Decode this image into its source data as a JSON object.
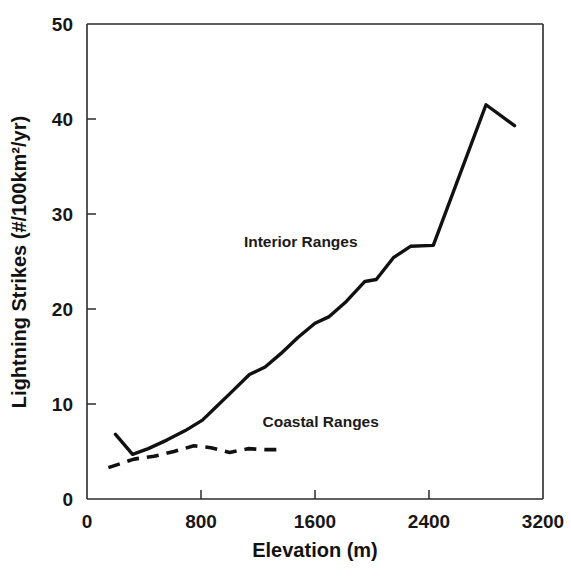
{
  "chart_data": {
    "type": "line",
    "title": "",
    "xlabel": "Elevation (m)",
    "ylabel": "Lightning Strikes (#/100km²/yr)",
    "xlim": [
      0,
      3200
    ],
    "ylim": [
      0,
      50
    ],
    "xticks": [
      0,
      800,
      1600,
      2400,
      3200
    ],
    "yticks": [
      0,
      10,
      20,
      30,
      40,
      50
    ],
    "xtick_labels": [
      "0",
      "800",
      "1600",
      "2400",
      "3200"
    ],
    "ytick_labels": [
      "0",
      "10",
      "20",
      "30",
      "40",
      "50"
    ],
    "grid": false,
    "legend_position": "inline-annotation",
    "series": [
      {
        "name": "Interior Ranges",
        "style": "solid",
        "label_x": 1500,
        "label_y": 26.5,
        "points": [
          [
            200,
            6.8
          ],
          [
            320,
            4.7
          ],
          [
            430,
            5.3
          ],
          [
            560,
            6.2
          ],
          [
            690,
            7.2
          ],
          [
            810,
            8.3
          ],
          [
            900,
            9.6
          ],
          [
            1010,
            11.2
          ],
          [
            1140,
            13.1
          ],
          [
            1250,
            13.9
          ],
          [
            1360,
            15.3
          ],
          [
            1480,
            17.0
          ],
          [
            1600,
            18.5
          ],
          [
            1700,
            19.2
          ],
          [
            1820,
            20.8
          ],
          [
            1950,
            22.9
          ],
          [
            2030,
            23.1
          ],
          [
            2150,
            25.4
          ],
          [
            2270,
            26.6
          ],
          [
            2430,
            26.7
          ],
          [
            2800,
            41.5
          ],
          [
            3000,
            39.3
          ]
        ]
      },
      {
        "name": "Coastal Ranges",
        "style": "dashed",
        "label_x": 1640,
        "label_y": 7.6,
        "points": [
          [
            150,
            3.3
          ],
          [
            330,
            4.2
          ],
          [
            470,
            4.5
          ],
          [
            610,
            5.0
          ],
          [
            750,
            5.6
          ],
          [
            870,
            5.4
          ],
          [
            1000,
            4.9
          ],
          [
            1130,
            5.3
          ],
          [
            1250,
            5.2
          ],
          [
            1350,
            5.2
          ]
        ]
      }
    ]
  },
  "figure": {
    "caption_fragment": ""
  }
}
